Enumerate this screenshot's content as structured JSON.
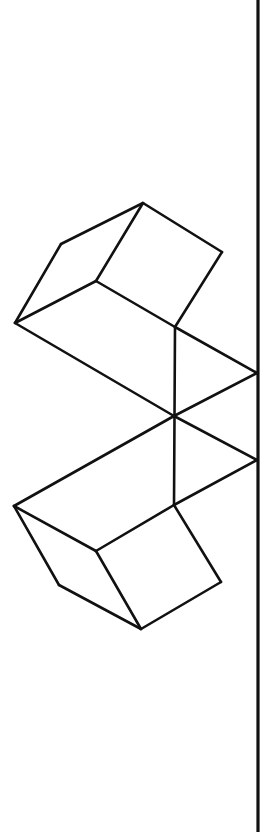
{
  "diagram": {
    "stroke_color": "#111111",
    "background": "#ffffff",
    "vertical_line": {
      "x": 258,
      "y1": 0,
      "y2": 832
    },
    "upper_cube": {
      "vertices": {
        "top": [
          143,
          203
        ],
        "left_upper": [
          61,
          244
        ],
        "right_top": [
          222,
          252
        ],
        "mid_inner": [
          96,
          281
        ],
        "left": [
          15,
          323
        ],
        "inner_right": [
          175,
          327
        ]
      }
    },
    "connector": {
      "right_upper": [
        257,
        373
      ],
      "center": [
        174,
        416
      ],
      "right_lower": [
        257,
        460
      ]
    },
    "lower_cube": {
      "vertices": {
        "left": [
          14,
          506
        ],
        "inner": [
          174,
          505
        ],
        "mid": [
          96,
          551
        ],
        "left_lower": [
          59,
          585
        ],
        "right_bottom": [
          221,
          582
        ],
        "bottom": [
          141,
          629
        ]
      }
    }
  }
}
